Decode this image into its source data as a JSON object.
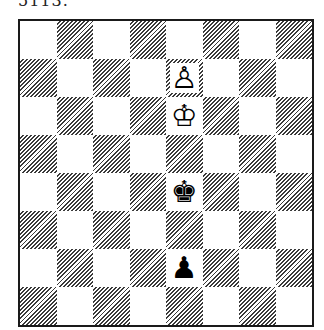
{
  "caption": "5113.",
  "board": {
    "orientation": "white-bottom",
    "files": [
      "a",
      "b",
      "c",
      "d",
      "e",
      "f",
      "g",
      "h"
    ],
    "ranks": [
      8,
      7,
      6,
      5,
      4,
      3,
      2,
      1
    ],
    "light_color": "#ffffff",
    "dark_style": "diagonal-hatch",
    "pieces": [
      {
        "square": "e7",
        "color": "white",
        "type": "pawn",
        "glyph": "♙",
        "icon": "white-pawn-icon"
      },
      {
        "square": "e6",
        "color": "white",
        "type": "king",
        "glyph": "♔",
        "icon": "white-king-icon"
      },
      {
        "square": "e4",
        "color": "black",
        "type": "king",
        "glyph": "♚",
        "icon": "black-king-icon"
      },
      {
        "square": "e2",
        "color": "black",
        "type": "pawn",
        "glyph": "♟",
        "icon": "black-pawn-icon"
      }
    ]
  }
}
